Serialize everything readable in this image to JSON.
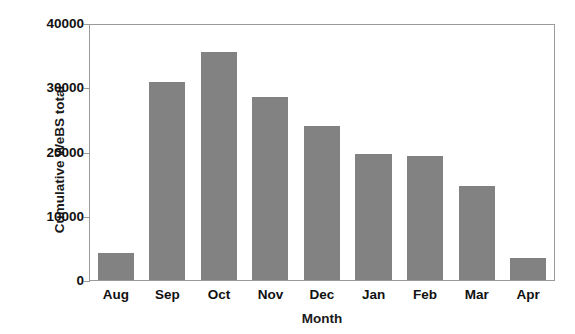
{
  "chart_data": {
    "type": "bar",
    "title": "",
    "xlabel": "Month",
    "ylabel": "Cumulative WeBS total",
    "categories": [
      "Aug",
      "Sep",
      "Oct",
      "Nov",
      "Dec",
      "Jan",
      "Feb",
      "Mar",
      "Apr"
    ],
    "values": [
      4200,
      31100,
      35800,
      28700,
      24200,
      19700,
      19400,
      14800,
      3500
    ],
    "ylim": [
      0,
      40000
    ],
    "yticks": [
      0,
      10000,
      20000,
      30000,
      40000
    ],
    "ytick_labels": [
      "0",
      "10000",
      "20000",
      "30000",
      "40000"
    ],
    "grid": false,
    "legend": null,
    "bar_color": "#828282",
    "axis_color": "#9a9a9a",
    "background_color": "#ffffff"
  },
  "axes": {
    "y_title": "Cumulative WeBS total",
    "x_title": "Month"
  }
}
